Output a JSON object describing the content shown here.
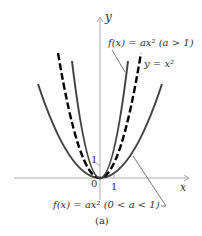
{
  "figure": {
    "caption": "(a)",
    "axes": {
      "x_label": "x",
      "y_label": "y",
      "origin_label": "0",
      "x_tick_label": "1",
      "y_tick_label": "1"
    },
    "curves": [
      {
        "id": "narrow",
        "label": "f(x) = ax² (a > 1)",
        "style": "solid",
        "color": "#444444"
      },
      {
        "id": "base",
        "label": "y = x²",
        "style": "dashed",
        "color": "#000000"
      },
      {
        "id": "wide",
        "label": "f(x) = ax² (0 < a < 1)",
        "style": "solid",
        "color": "#444444"
      }
    ],
    "colors": {
      "axis": "#aaaaaa",
      "leader": "#555555"
    }
  }
}
